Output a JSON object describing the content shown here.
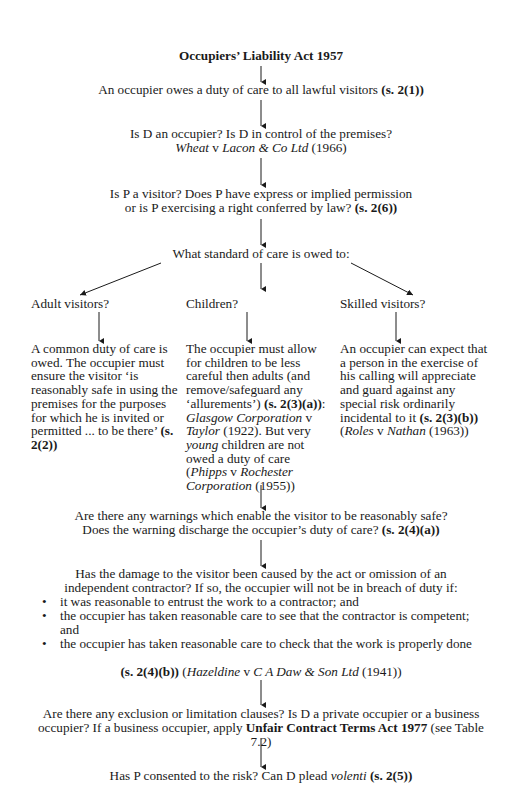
{
  "title": "Occupiers’ Liability Act 1957",
  "nodes": {
    "duty": {
      "text": "An occupier owes a duty of care to all lawful visitors ",
      "ref": "(s. 2(1))"
    },
    "occupier": {
      "line1": "Is D an occupier? Is D in control of the premises?",
      "case_a": "Wheat",
      "v": " v ",
      "case_b": "Lacon & Co Ltd",
      "year": " (1966)"
    },
    "visitor": {
      "line1": "Is P a visitor? Does P have express or implied permission",
      "line2": "or is P exercising a right conferred by law? ",
      "ref": "(s. 2(6))"
    },
    "standard": {
      "text": "What standard of care is owed to:"
    }
  },
  "branches": [
    {
      "label": "Adult visitors?",
      "body_pre": "A common duty of care is owed. The occupier must ensure the visitor ‘is reasonably safe in using the premises for the purposes for which he is invited or permitted ... to be there’ ",
      "ref": "(s. 2(2))"
    },
    {
      "label": "Children?",
      "body_pre": "The occupier must allow for children to be less careful then adults (and remove/safeguard any ‘allurements’) ",
      "ref": "(s. 2(3)(a))",
      "colon": ": ",
      "case1_a": "Glasgow Corporation",
      "case1_v": " v ",
      "case1_b": "Taylor",
      "case1_year": " (1922). But very ",
      "young": "young",
      "body_post": " children are not owed a duty of care (",
      "case2_a": "Phipps",
      "case2_v": " v ",
      "case2_b": "Rochester Corporation",
      "case2_year": " (1955))"
    },
    {
      "label": "Skilled visitors?",
      "body_pre": "An occupier can expect that a person in the exercise of his calling will appreciate and guard against any special risk ordinarily incidental to it ",
      "ref": "(s. 2(3)(b))",
      "open": " (",
      "case_a": "Roles",
      "case_v": " v ",
      "case_b": "Nathan",
      "case_year": " (1963))"
    }
  ],
  "warnings": {
    "line1": "Are there any warnings which enable the visitor to be reasonably safe?",
    "line2": "Does the warning discharge the occupier’s duty of care? ",
    "ref": "(s. 2(4)(a))"
  },
  "contractor": {
    "line1": "Has the damage to the visitor been caused by the act or omission of an",
    "line2": "independent contractor? If so, the occupier will not be in breach of duty if:",
    "bullets": [
      "it was reasonable to entrust the work to a contractor; and",
      "the occupier has taken reasonable care to see that the contractor is competent; and",
      "the occupier has taken reasonable care to check that the work is properly done"
    ],
    "ref": "(s. 2(4)(b))",
    "case_open": " (",
    "case_a": "Hazeldine",
    "case_v": " v ",
    "case_b": "C A Daw & Son Ltd",
    "case_year": " (1941))"
  },
  "exclusion": {
    "line1": "Are there any exclusion or limitation clauses? Is D a private occupier or a",
    "line2_pre": "business occupier? If a business occupier, apply ",
    "act": "Unfair Contract Terms Act 1977",
    "post": " (see Table 7.2)"
  },
  "consent": {
    "pre": "Has P consented to the risk? Can D plead ",
    "volenti": "volenti",
    "ref": " (s. 2(5))"
  },
  "bullet_glyph": "•"
}
